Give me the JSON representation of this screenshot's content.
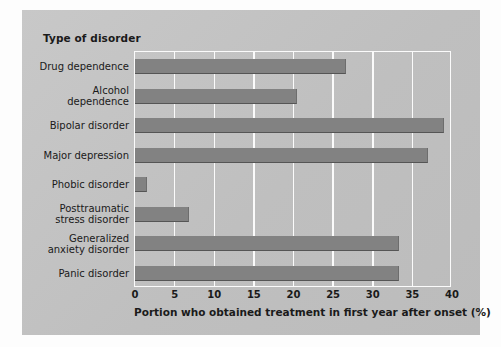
{
  "chart_data": {
    "type": "bar",
    "orientation": "horizontal",
    "title": "Type of disorder",
    "xlabel": "Portion who obtained treatment in first year after onset (%)",
    "ylabel": "Type of disorder",
    "categories": [
      "Drug dependence",
      "Alcohol\ndependence",
      "Bipolar disorder",
      "Major depression",
      "Phobic disorder",
      "Posttraumatic\nstress disorder",
      "Generalized\nanxiety disorder",
      "Panic disorder"
    ],
    "values": [
      26.6,
      20.5,
      39.0,
      37.0,
      1.5,
      6.8,
      33.3,
      33.3
    ],
    "xlim": [
      0,
      40
    ],
    "xticks": [
      0,
      5,
      10,
      15,
      20,
      25,
      30,
      35,
      40
    ],
    "xtick_labels": [
      "0",
      "5",
      "10",
      "15",
      "20",
      "25",
      "30",
      "35",
      "40"
    ],
    "grid": "vertical-white",
    "legend": "none",
    "bar_color": "#828282",
    "panel_color": "#c3c3c3",
    "gridline_color": "#fbfbfb",
    "text_color": "#1a1a1a"
  }
}
